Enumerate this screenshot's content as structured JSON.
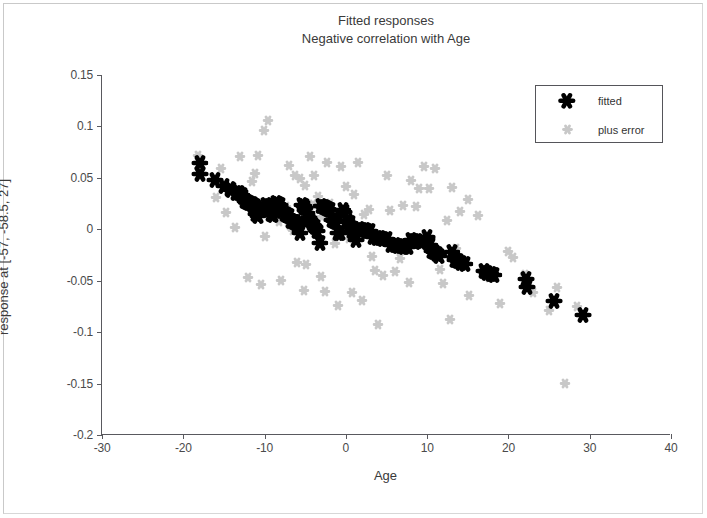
{
  "figure": {
    "title_line1": "Fitted responses",
    "title_line2": "Negative correlation with Age",
    "background_color": "#ffffff",
    "frame_color": "#c9c9c9"
  },
  "legend": {
    "position": "top-right",
    "border_color": "#55555a",
    "entries": [
      {
        "label": "fitted",
        "color": "#000000",
        "marker": "hexagram"
      },
      {
        "label": "plus error",
        "color": "#c8c8c8",
        "marker": "hexagram"
      }
    ]
  },
  "axes": {
    "x": {
      "label": "Age",
      "ticks": [
        -30,
        -20,
        -10,
        0,
        10,
        20,
        30,
        40
      ],
      "tick_labels": [
        "-30",
        "-20",
        "-10",
        "0",
        "10",
        "20",
        "30",
        "40"
      ],
      "min": -30,
      "max": 40
    },
    "y": {
      "label": "response at [-57, -58.5, 27]",
      "ticks": [
        0.15,
        0.1,
        0.05,
        0,
        -0.05,
        -0.1,
        -0.15,
        -0.2
      ],
      "tick_labels": [
        "0.15",
        "0.1",
        "0.05",
        "0",
        "-0.05",
        "-0.1",
        "-0.15",
        "-0.2"
      ],
      "min": -0.2,
      "max": 0.15
    }
  },
  "chart_data": {
    "type": "scatter",
    "title": "Fitted responses\nNegative correlation with Age",
    "xlabel": "Age",
    "ylabel": "response at [-57, -58.5, 27]",
    "xlim": [
      -30,
      40
    ],
    "ylim": [
      -0.2,
      0.15
    ],
    "grid": false,
    "legend_position": "upper right",
    "series": [
      {
        "name": "fitted",
        "color": "#000000",
        "marker": "hexagram",
        "marker_size": 8,
        "points": [
          [
            -18.0,
            0.0625
          ],
          [
            -17.9,
            0.0515
          ],
          [
            -16.1,
            0.0455
          ],
          [
            -15.0,
            0.0405
          ],
          [
            -14.3,
            0.0375
          ],
          [
            -14.1,
            0.0365
          ],
          [
            -13.5,
            0.0335
          ],
          [
            -13.2,
            0.033
          ],
          [
            -12.8,
            0.031
          ],
          [
            -12.6,
            0.0295
          ],
          [
            -12.4,
            0.0255
          ],
          [
            -12.2,
            0.025
          ],
          [
            -11.9,
            0.0235
          ],
          [
            -11.6,
            0.0225
          ],
          [
            -11.4,
            0.0215
          ],
          [
            -11.2,
            0.0205
          ],
          [
            -11.0,
            0.013
          ],
          [
            -10.8,
            0.011
          ],
          [
            -10.5,
            0.0195
          ],
          [
            -10.2,
            0.0185
          ],
          [
            -9.8,
            0.0215
          ],
          [
            -9.5,
            0.0205
          ],
          [
            -9.2,
            0.0125
          ],
          [
            -9.0,
            0.0115
          ],
          [
            -8.6,
            0.0235
          ],
          [
            -8.4,
            0.0225
          ],
          [
            -8.1,
            0.0215
          ],
          [
            -7.8,
            0.016
          ],
          [
            -7.5,
            0.0125
          ],
          [
            -7.2,
            0.012
          ],
          [
            -7.0,
            0.0105
          ],
          [
            -6.7,
            0.0065
          ],
          [
            -6.4,
            0.0055
          ],
          [
            -6.2,
            0.005
          ],
          [
            -6.0,
            0.0025
          ],
          [
            -5.7,
            -0.0055
          ],
          [
            -5.4,
            0.0215
          ],
          [
            -5.2,
            0.0205
          ],
          [
            -5.0,
            0.0185
          ],
          [
            -4.8,
            0.0135
          ],
          [
            -4.6,
            0.0095
          ],
          [
            -4.4,
            0.0075
          ],
          [
            -4.2,
            0.0045
          ],
          [
            -4.0,
            0.0025
          ],
          [
            -3.8,
            0.0005
          ],
          [
            -3.5,
            -0.0035
          ],
          [
            -3.2,
            -0.015
          ],
          [
            -3.0,
            0.0205
          ],
          [
            -2.7,
            0.0195
          ],
          [
            -2.5,
            0.0185
          ],
          [
            -2.2,
            0.0175
          ],
          [
            -2.0,
            0.0165
          ],
          [
            -1.7,
            0.007
          ],
          [
            -1.4,
            0.006
          ],
          [
            -1.2,
            0.005
          ],
          [
            -1.0,
            -0.0055
          ],
          [
            -0.7,
            -0.006
          ],
          [
            -0.4,
            0.017
          ],
          [
            -0.2,
            0.015
          ],
          [
            0.2,
            0.006
          ],
          [
            0.5,
            0.0045
          ],
          [
            0.8,
            -0.004
          ],
          [
            1.0,
            -0.0045
          ],
          [
            1.3,
            -0.012
          ],
          [
            1.6,
            -0.002
          ],
          [
            2.0,
            -0.0025
          ],
          [
            2.3,
            -0.003
          ],
          [
            2.6,
            -0.0035
          ],
          [
            3.0,
            -0.004
          ],
          [
            3.4,
            -0.0095
          ],
          [
            3.8,
            -0.01
          ],
          [
            4.2,
            -0.0105
          ],
          [
            4.6,
            -0.011
          ],
          [
            5.0,
            -0.0115
          ],
          [
            5.6,
            -0.017
          ],
          [
            6.0,
            -0.0175
          ],
          [
            6.4,
            -0.018
          ],
          [
            6.8,
            -0.0185
          ],
          [
            7.2,
            -0.019
          ],
          [
            7.6,
            -0.0195
          ],
          [
            8.0,
            -0.0125
          ],
          [
            8.4,
            -0.013
          ],
          [
            8.8,
            -0.0135
          ],
          [
            9.2,
            -0.014
          ],
          [
            10.0,
            -0.009
          ],
          [
            10.3,
            -0.017
          ],
          [
            10.6,
            -0.0235
          ],
          [
            10.9,
            -0.0245
          ],
          [
            11.2,
            -0.026
          ],
          [
            11.5,
            -0.0275
          ],
          [
            13.0,
            -0.0245
          ],
          [
            13.4,
            -0.032
          ],
          [
            13.8,
            -0.033
          ],
          [
            14.2,
            -0.0345
          ],
          [
            14.6,
            -0.036
          ],
          [
            17.0,
            -0.0425
          ],
          [
            17.4,
            -0.044
          ],
          [
            17.8,
            -0.045
          ],
          [
            18.2,
            -0.046
          ],
          [
            22.2,
            -0.05
          ],
          [
            22.3,
            -0.0585
          ],
          [
            25.6,
            -0.0715
          ],
          [
            29.2,
            -0.0855
          ]
        ]
      },
      {
        "name": "plus error",
        "color": "#c8c8c8",
        "marker": "hexagram",
        "marker_size": 5,
        "points": [
          [
            -18.2,
            0.071
          ],
          [
            -16.0,
            0.03
          ],
          [
            -14.8,
            0.0155
          ],
          [
            -13.6,
            0.0015
          ],
          [
            -12.4,
            0.0285
          ],
          [
            -11.5,
            0.046
          ],
          [
            -10.8,
            0.0715
          ],
          [
            -10.1,
            0.096
          ],
          [
            -9.6,
            0.1055
          ],
          [
            -9.9,
            -0.0075
          ],
          [
            -9.3,
            0.0255
          ],
          [
            -8.8,
            0.0145
          ],
          [
            -8.2,
            0.0075
          ],
          [
            -7.4,
            0.0215
          ],
          [
            -6.9,
            0.003
          ],
          [
            -6.5,
            -0.002
          ],
          [
            -6.2,
            0.0515
          ],
          [
            -5.6,
            0.049
          ],
          [
            -5.0,
            0.0425
          ],
          [
            -4.9,
            -0.035
          ],
          [
            -4.1,
            0.024
          ],
          [
            -3.9,
            0.052
          ],
          [
            -3.4,
            0.031
          ],
          [
            -2.9,
            0.012
          ],
          [
            -2.3,
            0.0645
          ],
          [
            -1.9,
            0.025
          ],
          [
            -1.3,
            -0.014
          ],
          [
            -0.6,
            0.0605
          ],
          [
            0.0,
            0.041
          ],
          [
            0.4,
            -0.0095
          ],
          [
            1.0,
            0.0335
          ],
          [
            1.5,
            0.064
          ],
          [
            2.2,
            0.0135
          ],
          [
            2.8,
            0.019
          ],
          [
            3.2,
            -0.0265
          ],
          [
            3.6,
            -0.0405
          ],
          [
            4.0,
            -0.0935
          ],
          [
            4.6,
            -0.0455
          ],
          [
            5.4,
            0.0175
          ],
          [
            6.0,
            -0.042
          ],
          [
            6.6,
            -0.0285
          ],
          [
            7.0,
            0.0225
          ],
          [
            7.8,
            -0.052
          ],
          [
            8.6,
            0.022
          ],
          [
            9.0,
            0.0395
          ],
          [
            9.6,
            0.0605
          ],
          [
            10.2,
            0.0395
          ],
          [
            11.0,
            0.0585
          ],
          [
            11.6,
            -0.04
          ],
          [
            12.0,
            -0.053
          ],
          [
            12.4,
            0.0085
          ],
          [
            13.0,
            0.04
          ],
          [
            13.6,
            -0.0195
          ],
          [
            14.0,
            0.017
          ],
          [
            15.2,
            -0.065
          ],
          [
            16.2,
            0.013
          ],
          [
            17.0,
            -0.0385
          ],
          [
            17.6,
            -0.047
          ],
          [
            18.4,
            -0.044
          ],
          [
            19.0,
            -0.0725
          ],
          [
            20.6,
            -0.0275
          ],
          [
            22.0,
            -0.044
          ],
          [
            23.0,
            -0.062
          ],
          [
            25.0,
            -0.079
          ],
          [
            26.0,
            -0.057
          ],
          [
            27.0,
            -0.15
          ],
          [
            28.4,
            -0.076
          ],
          [
            -12.0,
            -0.047
          ],
          [
            -10.4,
            -0.054
          ],
          [
            -8.0,
            -0.05
          ],
          [
            -5.2,
            -0.06
          ],
          [
            -2.6,
            -0.061
          ],
          [
            0.8,
            -0.062
          ],
          [
            -7.0,
            0.062
          ],
          [
            -4.4,
            0.0705
          ],
          [
            -11.2,
            0.054
          ],
          [
            -15.4,
            0.059
          ],
          [
            5.0,
            0.052
          ],
          [
            8.0,
            0.047
          ],
          [
            -3.0,
            -0.046
          ],
          [
            2.0,
            -0.07
          ],
          [
            -13.0,
            0.07
          ],
          [
            -6.0,
            -0.033
          ],
          [
            15.0,
            0.028
          ],
          [
            20.0,
            -0.022
          ],
          [
            12.8,
            -0.088
          ],
          [
            -1.0,
            -0.0745
          ]
        ]
      }
    ]
  }
}
